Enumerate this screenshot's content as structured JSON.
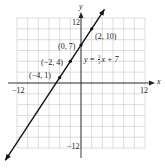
{
  "chart_data": {
    "type": "line",
    "title": "",
    "xlabel": "x",
    "ylabel": "y",
    "xlim": [
      -12,
      12
    ],
    "ylim": [
      -12,
      12
    ],
    "grid": true,
    "grid_step": 2,
    "tick_labels": {
      "x_min": "−12",
      "x_max": "12",
      "y_min": "−12",
      "y_max": "12"
    },
    "series": [
      {
        "name": "y = 3/2 x + 7",
        "slope": 1.5,
        "intercept": 7,
        "x": [
          -12,
          -4,
          -2,
          0,
          2,
          3.3
        ],
        "y": [
          -11,
          1,
          4,
          7,
          10,
          12
        ]
      }
    ],
    "points": [
      {
        "x": -4,
        "y": 1,
        "label": "(−4, 1)"
      },
      {
        "x": -2,
        "y": 4,
        "label": "(−2, 4)"
      },
      {
        "x": 0,
        "y": 7,
        "label": "(0, 7)"
      },
      {
        "x": 2,
        "y": 10,
        "label": "(2, 10)"
      }
    ],
    "annotations": [
      {
        "text": "y = ",
        "fraction": {
          "num": "3",
          "den": "2"
        },
        "suffix": "x + 7"
      }
    ],
    "colors": {
      "line": "#111111",
      "grid": "#c8c8c8",
      "axis": "#222222"
    }
  },
  "labels": {
    "x_axis": "x",
    "y_axis": "y",
    "x_min": "−12",
    "x_max": "12",
    "y_min": "−12",
    "y_max": "12",
    "pt1": "(−4, 1)",
    "pt2": "(−2, 4)",
    "pt3": "(0, 7)",
    "pt4": "(2, 10)",
    "eq_prefix": "y = ",
    "eq_num": "3",
    "eq_den": "2",
    "eq_suffix": "x + 7"
  }
}
